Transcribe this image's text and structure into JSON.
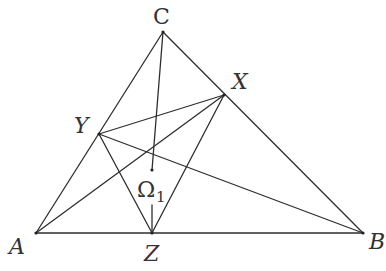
{
  "diagram": {
    "type": "geometry",
    "line_color": "#2e2e2e",
    "label_color": "#333333",
    "points": {
      "A": {
        "label": "A",
        "x": 36,
        "y": 233
      },
      "B": {
        "label": "B",
        "x": 363,
        "y": 233
      },
      "C": {
        "label": "C",
        "x": 163,
        "y": 32
      },
      "X": {
        "label": "X",
        "x": 224,
        "y": 95
      },
      "Y": {
        "label": "Y",
        "x": 99,
        "y": 134
      },
      "Z": {
        "label": "Z",
        "x": 152,
        "y": 233
      },
      "O": {
        "label": "Ω",
        "subscript": "1",
        "x": 152,
        "y": 170
      }
    },
    "segments": [
      [
        "A",
        "B"
      ],
      [
        "B",
        "C"
      ],
      [
        "C",
        "A"
      ],
      [
        "X",
        "Y"
      ],
      [
        "Y",
        "Z"
      ],
      [
        "Z",
        "X"
      ],
      [
        "C",
        "O"
      ],
      [
        "Y",
        "B"
      ],
      [
        "A",
        "X"
      ],
      [
        "O",
        "Z"
      ]
    ],
    "labels": {
      "A": "A",
      "B": "B",
      "C": "C",
      "X": "X",
      "Y": "Y",
      "Z": "Z",
      "omega": "Ω",
      "omega_sub": "1"
    }
  }
}
